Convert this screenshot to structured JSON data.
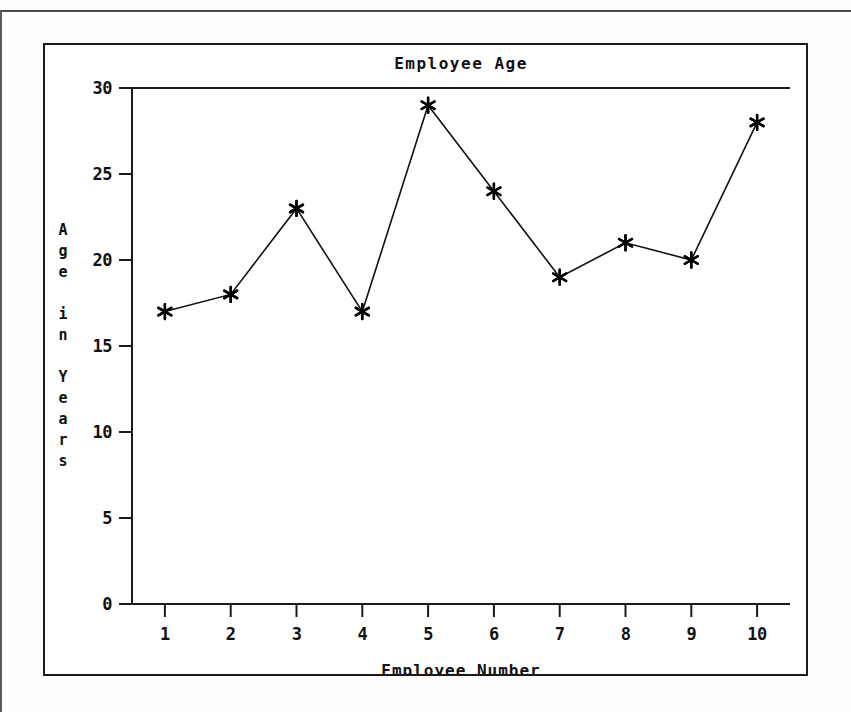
{
  "chart_data": {
    "type": "line",
    "title": "Employee Age",
    "xlabel": "Employee Number",
    "ylabel": "Age in Years",
    "ylabel_chars": [
      "A",
      "g",
      "e",
      "",
      "i",
      "n",
      "",
      "Y",
      "e",
      "a",
      "r",
      "s"
    ],
    "categories": [
      "1",
      "2",
      "3",
      "4",
      "5",
      "6",
      "7",
      "8",
      "9",
      "10"
    ],
    "x": [
      1,
      2,
      3,
      4,
      5,
      6,
      7,
      8,
      9,
      10
    ],
    "values": [
      17,
      18,
      23,
      17,
      29,
      24,
      19,
      21,
      20,
      28
    ],
    "xlim": [
      0.5,
      10.5
    ],
    "ylim": [
      0,
      30
    ],
    "yticks": [
      0,
      5,
      10,
      15,
      20,
      25,
      30
    ],
    "ytick_labels": [
      "0",
      "5",
      "10",
      "15",
      "20",
      "25",
      "30"
    ],
    "xticks": [
      1,
      2,
      3,
      4,
      5,
      6,
      7,
      8,
      9,
      10
    ],
    "xtick_labels": [
      "1",
      "2",
      "3",
      "4",
      "5",
      "6",
      "7",
      "8",
      "9",
      "10"
    ],
    "grid": false,
    "legend": null,
    "marker": "asterisk",
    "line_color": "#111111",
    "marker_color": "#000000",
    "background_color": "#ffffff",
    "frame_color": "#1a1a1a"
  },
  "figure": {
    "frame_label": "chart-frame",
    "page_background": "#fdfdfd"
  }
}
